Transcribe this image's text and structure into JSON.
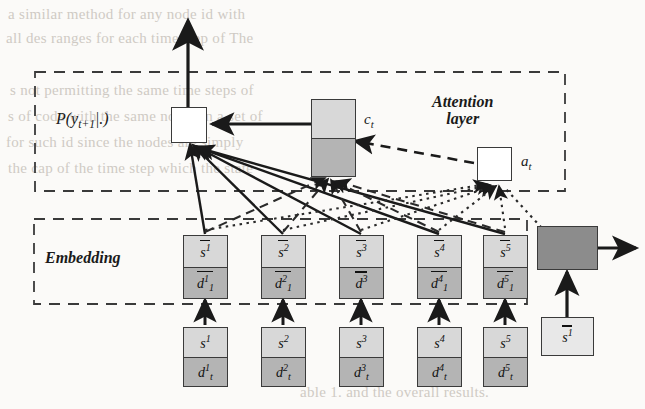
{
  "figure": {
    "type": "neural-network-architecture-diagram",
    "regions": [
      {
        "id": "attention",
        "label": "Attention layer",
        "label_line1": "Attention",
        "label_line2": "layer"
      },
      {
        "id": "embedding",
        "label": "Embedding"
      }
    ],
    "output_node": {
      "name": "output-probability-box",
      "label": "P(y",
      "label_sub": "t+1",
      "label_tail": "|.)",
      "fill": "#ffffff"
    },
    "context_node": {
      "name": "context-vector-box",
      "label": "c",
      "label_sub": "t",
      "fill_top": "#c9c9c9",
      "fill_bottom": "#b0b0b0"
    },
    "attention_node": {
      "name": "attention-weight-box",
      "label": "a",
      "label_sub": "t",
      "fill": "#ffffff"
    },
    "embedding_cells": [
      {
        "top": "s",
        "top_sup": "1",
        "top_overline": true,
        "bottom": "d",
        "bottom_sup": "1",
        "bottom_sub": "1",
        "bottom_overline": true
      },
      {
        "top": "s",
        "top_sup": "2",
        "top_overline": true,
        "bottom": "d",
        "bottom_sup": "2",
        "bottom_sub": "1",
        "bottom_overline": true
      },
      {
        "top": "s",
        "top_sup": "3",
        "top_overline": true,
        "bottom": "d",
        "bottom_sup": "3",
        "bottom_sub": "",
        "bottom_overline": true
      },
      {
        "top": "s",
        "top_sup": "4",
        "top_overline": true,
        "bottom": "d",
        "bottom_sup": "4",
        "bottom_sub": "1",
        "bottom_overline": true
      },
      {
        "top": "s",
        "top_sup": "5",
        "top_overline": true,
        "bottom": "d",
        "bottom_sup": "5",
        "bottom_sub": "1",
        "bottom_overline": true
      }
    ],
    "input_cells": [
      {
        "top": "s",
        "top_sup": "1",
        "bottom": "d",
        "bottom_sup": "1",
        "bottom_sub": "t"
      },
      {
        "top": "s",
        "top_sup": "2",
        "bottom": "d",
        "bottom_sup": "2",
        "bottom_sub": "t"
      },
      {
        "top": "s",
        "top_sup": "3",
        "bottom": "d",
        "bottom_sup": "3",
        "bottom_sub": "t"
      },
      {
        "top": "s",
        "top_sup": "4",
        "bottom": "d",
        "bottom_sup": "4",
        "bottom_sub": "t"
      },
      {
        "top": "s",
        "top_sup": "5",
        "bottom": "d",
        "bottom_sup": "5",
        "bottom_sub": "t"
      }
    ],
    "side_nodes": {
      "dark_box": {
        "name": "query-state-box",
        "fill": "#8c8c8c"
      },
      "query_input": {
        "label": "s",
        "label_sup": "1",
        "label_overline": true,
        "fill": "#e8e8e8"
      }
    },
    "colors": {
      "ink": "#1a1a1a",
      "cell_top": "#d8d8d8",
      "cell_bottom": "#b4b4b4",
      "context_top": "#c9c9c9",
      "context_bottom": "#b0b0b0",
      "dark_box": "#8c8c8c",
      "page": "#fbfaf8",
      "bleed_text": "#cfcac4"
    }
  },
  "background_text": {
    "lines": [
      "a similar method for any node id with",
      "all des ranges for each time step of The",
      "s not permitting the same time steps of",
      "s of code with the same nodes in a set of",
      "for such id since the nodes are simply",
      "the cap of the time step which the state",
      "able 1. and the overall results."
    ]
  }
}
